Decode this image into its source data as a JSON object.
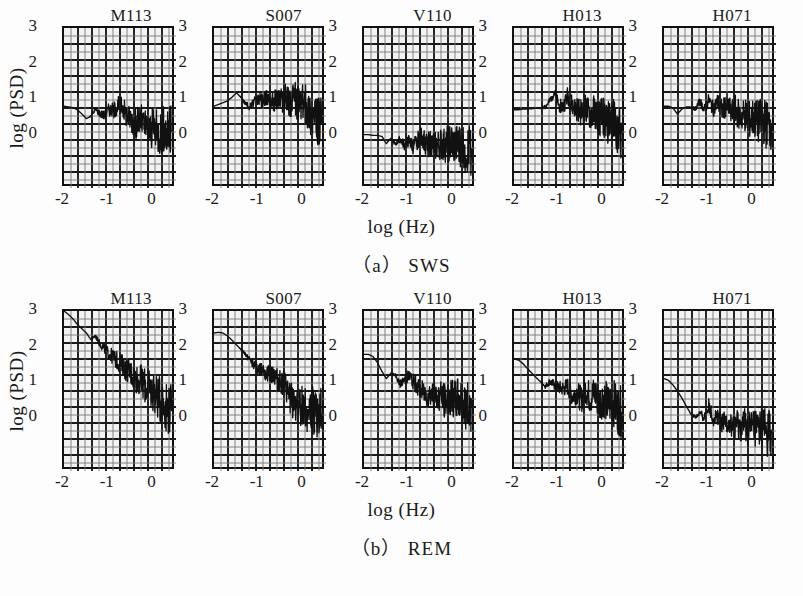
{
  "figure": {
    "y_axis_label": "log (PSD)",
    "x_axis_label": "log (Hz)",
    "panel_rows": [
      {
        "caption": "（a） SWS",
        "state": "SWS",
        "panels": [
          "M113",
          "S007",
          "V110",
          "H013",
          "H071"
        ]
      },
      {
        "caption": "（b） REM",
        "state": "REM",
        "panels": [
          "M113",
          "S007",
          "V110",
          "H013",
          "H071"
        ]
      }
    ],
    "y_ticks": [
      "3",
      "2",
      "1",
      "0"
    ],
    "x_ticks": [
      "-2",
      "-1",
      "0"
    ],
    "colors": {
      "ink": "#111111",
      "panel_fill": "#f2f2f2",
      "page": "#fdfdfd",
      "grid_major": "#1a1a1a",
      "grid_minor": "#777777"
    }
  },
  "chart_data": {
    "type": "line",
    "xlabel": "log (Hz)",
    "ylabel": "log (PSD)",
    "xlim": [
      -2.0,
      0.5
    ],
    "ylim": [
      -1.5,
      3.0
    ],
    "x_ticks": [
      -2,
      -1,
      0
    ],
    "y_ticks": [
      0,
      1,
      2,
      3
    ],
    "grid": true,
    "grid_columns": 8,
    "grid_rows": 10,
    "legend_position": "none",
    "panel_titles": [
      "M113",
      "S007",
      "V110",
      "H013",
      "H071"
    ],
    "row_captions": [
      "（a） SWS",
      "（b） REM"
    ],
    "panels": [
      {
        "row": "SWS",
        "name": "M113",
        "description": "Flat near 0.8 until log f ≈ -0.6 then noisy roll-off to ~0",
        "x": [
          -2.0,
          -1.9,
          -1.8,
          -1.7,
          -1.6,
          -1.5,
          -1.4,
          -1.3,
          -1.2,
          -1.1,
          -1.0,
          -0.9,
          -0.8,
          -0.7,
          -0.6,
          -0.5,
          -0.4,
          -0.3,
          -0.2,
          -0.1,
          0.0,
          0.1,
          0.2,
          0.3,
          0.4
        ],
        "y": [
          0.8,
          0.78,
          0.76,
          0.7,
          0.58,
          0.45,
          0.52,
          0.72,
          0.6,
          0.55,
          0.72,
          0.68,
          0.82,
          0.8,
          0.55,
          0.45,
          0.3,
          0.45,
          0.22,
          0.1,
          0.18,
          0.05,
          0.15,
          0.05,
          0.1
        ]
      },
      {
        "row": "SWS",
        "name": "S007",
        "description": "Flat plateau near 0.9-1.1 with noise, dropping to ~0.3 above log f = 0.2",
        "x": [
          -2.0,
          -1.9,
          -1.8,
          -1.7,
          -1.6,
          -1.5,
          -1.4,
          -1.3,
          -1.2,
          -1.1,
          -1.0,
          -0.9,
          -0.8,
          -0.7,
          -0.6,
          -0.5,
          -0.4,
          -0.3,
          -0.2,
          -0.1,
          0.0,
          0.1,
          0.2,
          0.3,
          0.4
        ],
        "y": [
          0.8,
          0.85,
          0.9,
          0.95,
          1.05,
          1.18,
          1.05,
          0.88,
          0.78,
          0.92,
          1.0,
          0.95,
          1.05,
          0.95,
          1.0,
          0.98,
          1.02,
          0.92,
          0.98,
          0.85,
          0.9,
          0.7,
          0.55,
          0.35,
          0.3
        ]
      },
      {
        "row": "SWS",
        "name": "V110",
        "description": "Flat near 0 with oscillation then noisy band from -0.4 to -0.1",
        "x": [
          -2.0,
          -1.9,
          -1.8,
          -1.7,
          -1.6,
          -1.5,
          -1.4,
          -1.3,
          -1.2,
          -1.1,
          -1.0,
          -0.9,
          -0.8,
          -0.7,
          -0.6,
          -0.5,
          -0.4,
          -0.3,
          -0.2,
          -0.1,
          0.0,
          0.1,
          0.2,
          0.3,
          0.4
        ],
        "y": [
          0.0,
          0.0,
          -0.02,
          -0.02,
          -0.05,
          -0.25,
          -0.1,
          -0.28,
          -0.12,
          -0.3,
          -0.18,
          -0.35,
          -0.15,
          -0.05,
          -0.3,
          -0.25,
          -0.35,
          -0.28,
          -0.32,
          -0.25,
          -0.3,
          -0.35,
          -0.28,
          -0.45,
          -0.4
        ]
      },
      {
        "row": "SWS",
        "name": "H013",
        "description": "Flat near 0.7 with a peak at log f = -1.0, then noisy decay to ~0",
        "x": [
          -2.0,
          -1.9,
          -1.8,
          -1.7,
          -1.6,
          -1.5,
          -1.4,
          -1.3,
          -1.2,
          -1.1,
          -1.0,
          -0.9,
          -0.8,
          -0.7,
          -0.6,
          -0.5,
          -0.4,
          -0.3,
          -0.2,
          -0.1,
          0.0,
          0.1,
          0.2,
          0.3,
          0.4
        ],
        "y": [
          0.7,
          0.7,
          0.72,
          0.72,
          0.73,
          0.75,
          0.74,
          0.78,
          0.95,
          1.2,
          0.82,
          0.78,
          1.1,
          0.8,
          0.72,
          0.6,
          0.7,
          0.55,
          0.62,
          0.45,
          0.5,
          0.35,
          0.4,
          0.2,
          0.05
        ]
      },
      {
        "row": "SWS",
        "name": "H071",
        "description": "Flat near 0.8, dip at -1.6, oscillating peaks near -1.0, then noisy decay to 0.3",
        "x": [
          -2.0,
          -1.9,
          -1.8,
          -1.7,
          -1.6,
          -1.5,
          -1.4,
          -1.3,
          -1.2,
          -1.1,
          -1.0,
          -0.9,
          -0.8,
          -0.7,
          -0.6,
          -0.5,
          -0.4,
          -0.3,
          -0.2,
          -0.1,
          0.0,
          0.1,
          0.2,
          0.3,
          0.4
        ],
        "y": [
          0.8,
          0.8,
          0.75,
          0.58,
          0.72,
          0.78,
          0.78,
          0.72,
          0.95,
          0.7,
          0.98,
          0.72,
          0.92,
          0.68,
          0.85,
          0.6,
          0.7,
          0.5,
          0.58,
          0.42,
          0.48,
          0.35,
          0.42,
          0.28,
          0.3
        ]
      },
      {
        "row": "REM",
        "name": "M113",
        "description": "Steep 1/f decay from 3.0 at log f = -2 to ~0.2 at log f = 0.3",
        "x": [
          -2.0,
          -1.9,
          -1.8,
          -1.7,
          -1.6,
          -1.5,
          -1.4,
          -1.3,
          -1.2,
          -1.1,
          -1.0,
          -0.9,
          -0.8,
          -0.7,
          -0.6,
          -0.5,
          -0.4,
          -0.3,
          -0.2,
          -0.1,
          0.0,
          0.1,
          0.2,
          0.3,
          0.4
        ],
        "y": [
          3.0,
          2.9,
          2.78,
          2.62,
          2.5,
          2.38,
          2.2,
          2.3,
          2.08,
          1.95,
          1.8,
          1.7,
          1.58,
          1.48,
          1.35,
          1.25,
          1.12,
          1.05,
          0.92,
          0.8,
          0.72,
          0.55,
          0.45,
          0.28,
          0.2
        ]
      },
      {
        "row": "REM",
        "name": "S007",
        "description": "Decay from 2.4 to ~0.1 with noisy tail past log f = -0.2",
        "x": [
          -2.0,
          -1.9,
          -1.8,
          -1.7,
          -1.6,
          -1.5,
          -1.4,
          -1.3,
          -1.2,
          -1.1,
          -1.0,
          -0.9,
          -0.8,
          -0.7,
          -0.6,
          -0.5,
          -0.4,
          -0.3,
          -0.2,
          -0.1,
          0.0,
          0.1,
          0.2,
          0.3,
          0.4
        ],
        "y": [
          2.38,
          2.4,
          2.38,
          2.3,
          2.18,
          2.05,
          1.92,
          1.78,
          1.62,
          1.48,
          1.35,
          1.4,
          1.2,
          1.28,
          1.05,
          1.0,
          0.8,
          0.55,
          0.42,
          0.25,
          0.35,
          0.12,
          0.22,
          0.05,
          0.1
        ]
      },
      {
        "row": "REM",
        "name": "V110",
        "description": "Starts at 1.8, drops to ~1.0 by log f = -1.2, noisy plateau near 0.6",
        "x": [
          -2.0,
          -1.9,
          -1.8,
          -1.7,
          -1.6,
          -1.5,
          -1.4,
          -1.3,
          -1.2,
          -1.1,
          -1.0,
          -0.9,
          -0.8,
          -0.7,
          -0.6,
          -0.5,
          -0.4,
          -0.3,
          -0.2,
          -0.1,
          0.0,
          0.1,
          0.2,
          0.3,
          0.4
        ],
        "y": [
          1.78,
          1.78,
          1.72,
          1.55,
          1.3,
          1.1,
          1.25,
          1.18,
          0.95,
          1.05,
          1.18,
          1.02,
          0.88,
          0.75,
          0.62,
          0.7,
          0.55,
          0.62,
          0.48,
          0.58,
          0.45,
          0.55,
          0.4,
          0.3,
          0.35
        ]
      },
      {
        "row": "REM",
        "name": "H013",
        "description": "Starts at 1.65, decays to ~0.9 by log f = -1.0, noisy band to ~0.2",
        "x": [
          -2.0,
          -1.9,
          -1.8,
          -1.7,
          -1.6,
          -1.5,
          -1.4,
          -1.3,
          -1.2,
          -1.1,
          -1.0,
          -0.9,
          -0.8,
          -0.7,
          -0.6,
          -0.5,
          -0.4,
          -0.3,
          -0.2,
          -0.1,
          0.0,
          0.1,
          0.2,
          0.3,
          0.4
        ],
        "y": [
          1.65,
          1.62,
          1.52,
          1.38,
          1.25,
          1.12,
          1.0,
          0.88,
          1.02,
          0.92,
          0.85,
          0.82,
          0.88,
          0.6,
          0.72,
          0.5,
          0.82,
          0.55,
          0.72,
          0.42,
          0.6,
          0.35,
          0.48,
          0.25,
          0.15
        ]
      },
      {
        "row": "REM",
        "name": "H071",
        "description": "Starts at 1.1, drops to ~0 by log f = -1.3, oscillates, noisy tail near -0.3",
        "x": [
          -2.0,
          -1.9,
          -1.8,
          -1.7,
          -1.6,
          -1.5,
          -1.4,
          -1.3,
          -1.2,
          -1.1,
          -1.0,
          -0.9,
          -0.8,
          -0.7,
          -0.6,
          -0.5,
          -0.4,
          -0.3,
          -0.2,
          -0.1,
          0.0,
          0.1,
          0.2,
          0.3,
          0.4
        ],
        "y": [
          1.1,
          1.05,
          0.92,
          0.75,
          0.55,
          0.32,
          0.1,
          0.02,
          0.12,
          0.0,
          0.35,
          -0.05,
          0.08,
          -0.2,
          -0.1,
          -0.28,
          -0.15,
          -0.3,
          -0.22,
          -0.32,
          -0.25,
          -0.35,
          -0.3,
          -0.4,
          -0.35
        ]
      }
    ]
  }
}
